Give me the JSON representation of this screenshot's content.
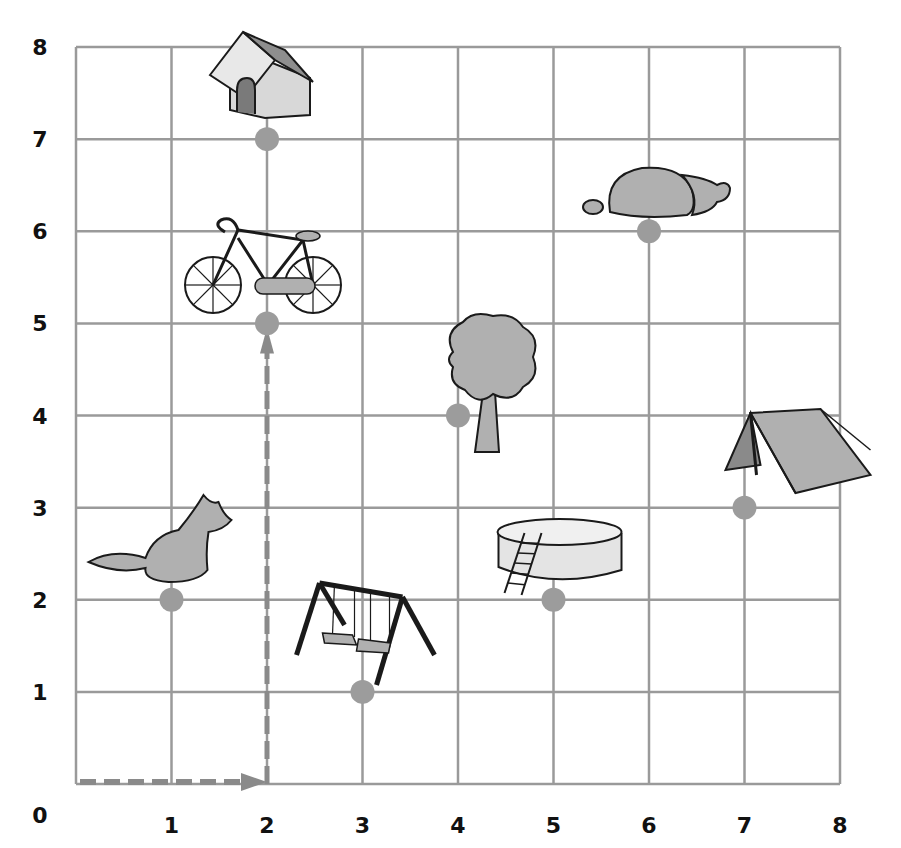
{
  "chart_data": {
    "type": "scatter",
    "title": "",
    "xlabel": "",
    "ylabel": "",
    "xlim": [
      0,
      8
    ],
    "ylim": [
      0,
      8
    ],
    "grid": true,
    "x_ticks": [
      "0",
      "1",
      "2",
      "3",
      "4",
      "5",
      "6",
      "7",
      "8"
    ],
    "y_ticks": [
      "1",
      "2",
      "3",
      "4",
      "5",
      "6",
      "7",
      "8"
    ],
    "points": [
      {
        "name": "Doghouse",
        "x": 2,
        "y": 7
      },
      {
        "name": "Bicycle",
        "x": 2,
        "y": 5
      },
      {
        "name": "Rocks",
        "x": 6,
        "y": 6
      },
      {
        "name": "Tree",
        "x": 4,
        "y": 4
      },
      {
        "name": "Tent",
        "x": 7,
        "y": 3
      },
      {
        "name": "Dog",
        "x": 1,
        "y": 2
      },
      {
        "name": "Pool",
        "x": 5,
        "y": 2
      },
      {
        "name": "Swing set",
        "x": 3,
        "y": 1
      }
    ],
    "path": {
      "description": "dashed arrows from origin right to (2,0) then up to (2,5)",
      "segments": [
        {
          "from": [
            0,
            0
          ],
          "to": [
            2,
            0
          ]
        },
        {
          "from": [
            2,
            0
          ],
          "to": [
            2,
            5
          ]
        }
      ]
    }
  },
  "axes": {
    "origin_label": "0",
    "x_labels": [
      "1",
      "2",
      "3",
      "4",
      "5",
      "6",
      "7",
      "8"
    ],
    "y_labels": [
      "1",
      "2",
      "3",
      "4",
      "5",
      "6",
      "7",
      "8"
    ]
  },
  "colors": {
    "grid": "#9a9a9a",
    "dot": "#9c9c9c",
    "arrow": "#8a8a8a",
    "fill": "#b0b0b0",
    "outline": "#1a1a1a"
  }
}
